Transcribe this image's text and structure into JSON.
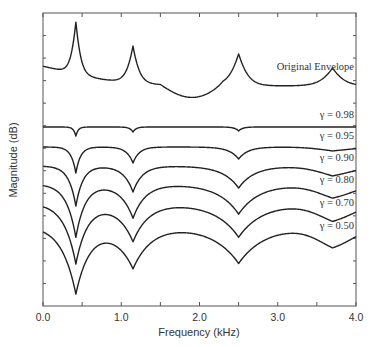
{
  "chart_data": {
    "type": "line",
    "title": "",
    "xlabel": "Frequency (kHz)",
    "ylabel": "Magnitude (dB)",
    "xlim": [
      0.0,
      4.0
    ],
    "x_ticks": [
      "0.0",
      "1.0",
      "2.0",
      "3.0",
      "4.0"
    ],
    "x_minor_step": 0.5,
    "y_tick_labels": false,
    "grid": false,
    "legend": "inline labels at right end of each curve",
    "formant_frequencies_khz": [
      0.42,
      1.15,
      2.5,
      3.7
    ],
    "series": [
      {
        "name": "Original Envelope",
        "label": "Original Envelope",
        "kind": "peaks",
        "baseline_y": 70,
        "depths": [
          52,
          37,
          32,
          18
        ],
        "widths": [
          0.07,
          0.09,
          0.13,
          0.16
        ],
        "label_y": 76
      },
      {
        "name": "γ = 0.98",
        "label": "γ = 0.98",
        "kind": "dips",
        "baseline_y": 127,
        "depths": [
          9,
          5,
          4,
          0
        ],
        "widths": [
          0.03,
          0.04,
          0.05,
          0.1
        ],
        "label_y": 124
      },
      {
        "name": "γ = 0.95",
        "label": "γ = 0.95",
        "kind": "dips",
        "baseline_y": 147,
        "depths": [
          26,
          16,
          12,
          2
        ],
        "widths": [
          0.06,
          0.08,
          0.12,
          0.2
        ],
        "label_y": 145
      },
      {
        "name": "γ = 0.90",
        "label": "γ = 0.90",
        "kind": "dips",
        "baseline_y": 166,
        "depths": [
          40,
          26,
          22,
          5
        ],
        "widths": [
          0.09,
          0.12,
          0.2,
          0.25
        ],
        "label_y": 167
      },
      {
        "name": "γ = 0.80",
        "label": "γ = 0.80",
        "kind": "dips",
        "baseline_y": 184,
        "depths": [
          53,
          34,
          30,
          7
        ],
        "widths": [
          0.12,
          0.16,
          0.26,
          0.3
        ],
        "label_y": 189
      },
      {
        "name": "γ = 0.70",
        "label": "γ = 0.70",
        "kind": "dips",
        "baseline_y": 203,
        "depths": [
          60,
          38,
          34,
          9
        ],
        "widths": [
          0.15,
          0.2,
          0.3,
          0.32
        ],
        "label_y": 212
      },
      {
        "name": "γ = 0.50",
        "label": "γ = 0.50",
        "kind": "dips",
        "baseline_y": 225,
        "depths": [
          67,
          42,
          38,
          11
        ],
        "widths": [
          0.18,
          0.24,
          0.34,
          0.34
        ],
        "label_y": 235
      }
    ]
  },
  "plot": {
    "left_px": 43,
    "right_px": 356,
    "top_px": 13,
    "bottom_px": 306,
    "line_color": "#222222",
    "axis_color": "#555555"
  }
}
